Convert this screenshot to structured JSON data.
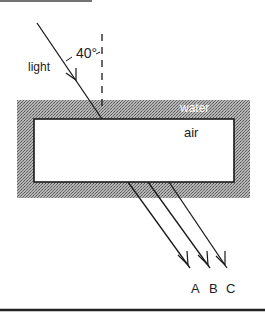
{
  "diagram": {
    "labels": {
      "light": "light",
      "angle": "40°",
      "water": "water",
      "air": "air"
    },
    "outgoing_rays": [
      {
        "label": "A"
      },
      {
        "label": "B"
      },
      {
        "label": "C"
      }
    ],
    "colors": {
      "water_fill": "#8a8a8a",
      "ink": "#1a1a1a",
      "air_fill": "#ffffff"
    }
  }
}
